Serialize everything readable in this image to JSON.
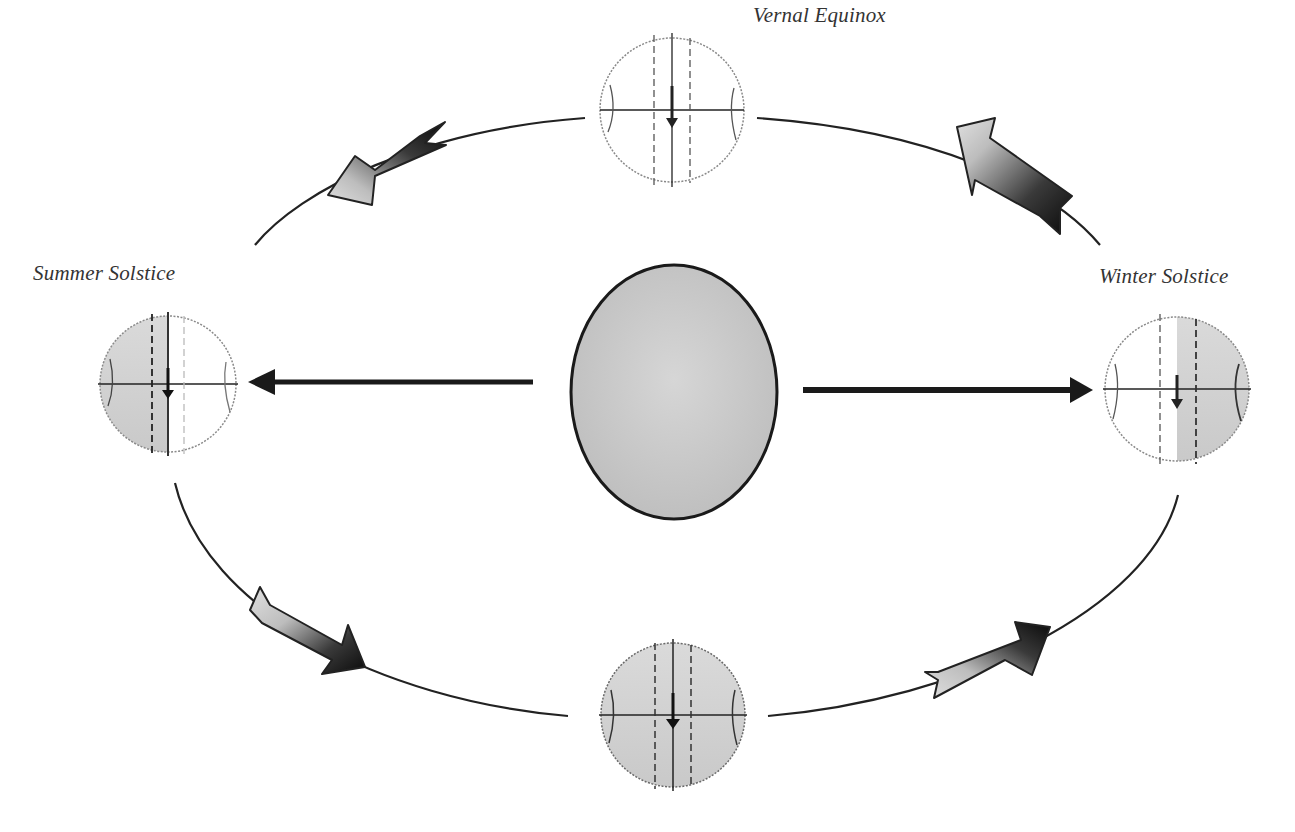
{
  "diagram": {
    "type": "orbit-diagram",
    "labels": {
      "vernal": "Vernal Equinox",
      "summer": "Summer Solstice",
      "winter": "Winter Solstice",
      "autumnal": ""
    },
    "center_body": {
      "name": "sun",
      "fill": "#c8c8c8",
      "stroke": "#222222"
    },
    "globes": [
      {
        "id": "top",
        "position": "top",
        "label_key": "vernal",
        "shading": "none"
      },
      {
        "id": "left",
        "position": "left",
        "label_key": "summer",
        "shading": "left-half"
      },
      {
        "id": "right",
        "position": "right",
        "label_key": "winter",
        "shading": "right-half"
      },
      {
        "id": "bottom",
        "position": "bottom",
        "label_key": "",
        "shading": "full"
      }
    ],
    "orbit_arrows": [
      "top-left",
      "top-right",
      "bottom-left",
      "bottom-right"
    ],
    "radial_arrows": [
      "sun-to-left",
      "sun-to-right"
    ],
    "colors": {
      "line": "#222222",
      "globe_shade": "#d2d2d2",
      "globe_outline": "#888888",
      "arrow_light": "#d8d8d8",
      "arrow_dark": "#111111"
    }
  }
}
